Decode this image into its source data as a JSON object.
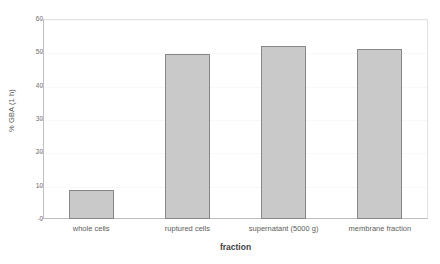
{
  "chart_data": {
    "type": "bar",
    "title": "",
    "xlabel": "fraction",
    "ylabel": "% GBA (1 h)",
    "categories": [
      "whole cells",
      "ruptured cells",
      "supernatant (5000 g)",
      "membrane fraction"
    ],
    "values": [
      8.8,
      49.5,
      52.0,
      51.0
    ],
    "ylim": [
      0,
      60
    ],
    "yticks": [
      0,
      10,
      20,
      30,
      40,
      50,
      60
    ],
    "ytick_labels": [
      "0",
      "10",
      "20",
      "30",
      "40",
      "50",
      "60"
    ],
    "grid": true,
    "legend": "none",
    "colors": {
      "bar_fill": "#c9c9c9",
      "bar_border": "#878787",
      "axis": "#bfbfbf",
      "grid": "#f2f2f2",
      "text": "#5a5a5a",
      "background": "#ffffff"
    }
  }
}
